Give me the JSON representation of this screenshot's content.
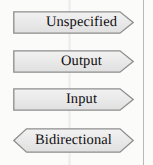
{
  "legend": {
    "title": "Port directionality legend",
    "background_color": "#fbfbfa",
    "shape_fill_color": "#e9e9e9",
    "shape_border_color": "#8a8a8a",
    "text_color": "#100e10",
    "margin_rule_color": "#b9b9bb",
    "items": [
      {
        "label": "Unspecified",
        "shape": "pennant-right",
        "left_edge": "flat",
        "right_edge": "point",
        "x": 13,
        "y": 11,
        "width": 121,
        "height": 23,
        "label_align": "right-shifted"
      },
      {
        "label": "Output",
        "shape": "pennant-right",
        "left_edge": "flat",
        "right_edge": "point",
        "x": 13,
        "y": 50,
        "width": 121,
        "height": 23,
        "label_align": "right-shifted"
      },
      {
        "label": "Input",
        "shape": "pennant-right",
        "left_edge": "flat",
        "right_edge": "point",
        "x": 13,
        "y": 88,
        "width": 121,
        "height": 23,
        "label_align": "right-shifted"
      },
      {
        "label": "Bidirectional",
        "shape": "double-arrow",
        "left_edge": "point",
        "right_edge": "point",
        "x": 13,
        "y": 128,
        "width": 121,
        "height": 25,
        "label_align": "centered"
      }
    ]
  }
}
